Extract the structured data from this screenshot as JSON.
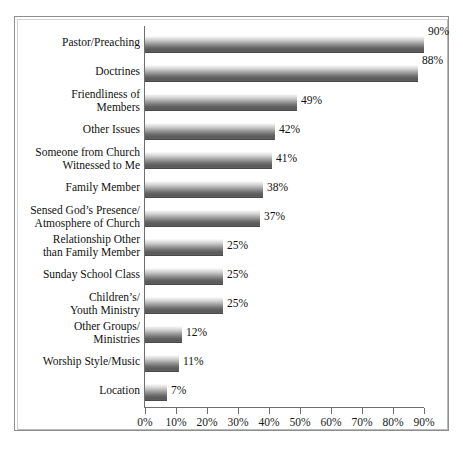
{
  "chart_data": {
    "type": "bar",
    "orientation": "horizontal",
    "title": "",
    "subtitle": "",
    "xlabel": "",
    "ylabel": "",
    "xlim": [
      0,
      90
    ],
    "grid": false,
    "legend": null,
    "xtick_labels": [
      "0%",
      "10%",
      "20%",
      "30%",
      "40%",
      "50%",
      "60%",
      "70%",
      "80%",
      "90%"
    ],
    "xtick_values": [
      0,
      10,
      20,
      30,
      40,
      50,
      60,
      70,
      80,
      90
    ],
    "categories": [
      "Pastor/Preaching",
      "Doctrines",
      "Friendliness of\nMembers",
      "Other Issues",
      "Someone from Church\nWitnessed to Me",
      "Family Member",
      "Sensed God’s Presence/\nAtmosphere of Church",
      "Relationship Other\nthan Family Member",
      "Sunday School Class",
      "Children’s/\nYouth Ministry",
      "Other Groups/\nMinistries",
      "Worship Style/Music",
      "Location"
    ],
    "values": [
      90,
      88,
      49,
      42,
      41,
      38,
      37,
      25,
      25,
      25,
      12,
      11,
      7
    ],
    "data_labels": [
      "90%",
      "88%",
      "49%",
      "42%",
      "41%",
      "38%",
      "37%",
      "25%",
      "25%",
      "25%",
      "12%",
      "11%",
      "7%"
    ],
    "bar_fill": "#7a7a7a",
    "bar_fill_top": "#ffffff",
    "bar_fill_bottom": "#5a5a5a",
    "axis_color": "#6f6f6f",
    "text_color": "#111111",
    "frame_color": "#8e8e8e",
    "background": "#ffffff"
  }
}
